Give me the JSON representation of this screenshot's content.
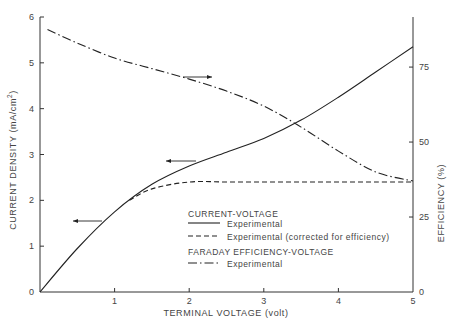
{
  "chart_data": {
    "type": "line",
    "title": "",
    "xlabel": "TERMINAL VOLTAGE (volt)",
    "ylabel": "CURRENT DENSITY (mA/cm2)",
    "ylabel_right": "EFFICIENCY (%)",
    "xlim": [
      0,
      5
    ],
    "ylim": [
      0,
      6
    ],
    "ylim_right": [
      0,
      91.7
    ],
    "x_ticks": [
      "1",
      "2",
      "3",
      "4",
      "5"
    ],
    "x_origin_label": "0",
    "y_ticks": [
      "0",
      "1",
      "2",
      "3",
      "4",
      "5",
      "6"
    ],
    "y_right_ticks": [
      "0",
      "25",
      "50",
      "75"
    ],
    "grid": false,
    "legend_position": "inside lower right",
    "legend": {
      "group1_title": "CURRENT-VOLTAGE",
      "group1_items": [
        {
          "label": "Experimental",
          "style": "solid"
        },
        {
          "label": "Experimental (corrected for efficiency)",
          "style": "dashed"
        }
      ],
      "group2_title": "FARADAY EFFICIENCY-VOLTAGE",
      "group2_items": [
        {
          "label": "Experimental",
          "style": "dash-dot"
        }
      ]
    },
    "series": [
      {
        "name": "Current-Voltage Experimental",
        "axis": "left",
        "style": "solid",
        "x": [
          0,
          0.5,
          1.0,
          1.5,
          2.0,
          2.5,
          3.0,
          3.5,
          4.0,
          4.5,
          5.0
        ],
        "values": [
          0,
          0.95,
          1.75,
          2.35,
          2.75,
          3.05,
          3.35,
          3.75,
          4.25,
          4.8,
          5.35
        ]
      },
      {
        "name": "Current-Voltage Experimental (corrected for efficiency)",
        "axis": "left",
        "style": "dashed",
        "x": [
          1.2,
          1.5,
          2.0,
          2.5,
          3.0,
          3.5,
          4.0,
          4.5,
          5.0
        ],
        "values": [
          2.0,
          2.25,
          2.4,
          2.4,
          2.4,
          2.4,
          2.4,
          2.4,
          2.4
        ]
      },
      {
        "name": "Faraday Efficiency-Voltage Experimental",
        "axis": "right",
        "style": "dash-dot",
        "x": [
          0.1,
          0.5,
          1.0,
          1.5,
          2.0,
          2.5,
          3.0,
          3.5,
          4.0,
          4.5,
          5.0
        ],
        "values": [
          87.5,
          83,
          78,
          74.5,
          71,
          67,
          62,
          55,
          47,
          40,
          37
        ]
      }
    ],
    "annotations": [
      {
        "type": "arrow",
        "direction": "left",
        "points_to": "left axis",
        "near_series": "Current-Voltage Experimental",
        "at_x": 0.8
      },
      {
        "type": "arrow",
        "direction": "left",
        "points_to": "left axis",
        "near_series": "Current-Voltage Experimental",
        "at_x": 1.6
      },
      {
        "type": "arrow",
        "direction": "right",
        "points_to": "right axis",
        "near_series": "Faraday Efficiency-Voltage Experimental",
        "at_x": 1.6
      }
    ]
  },
  "colors": {
    "line": "#222222",
    "axis": "#333333",
    "text": "#444444",
    "background": "#ffffff"
  }
}
